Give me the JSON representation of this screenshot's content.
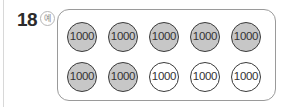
{
  "question": {
    "number": "18",
    "badge": "예"
  },
  "coins": {
    "label": "1000",
    "rows": [
      [
        "gray",
        "gray",
        "gray",
        "gray",
        "gray"
      ],
      [
        "gray",
        "gray",
        "white",
        "white",
        "white"
      ]
    ]
  },
  "colors": {
    "filled": "#c7c7c7",
    "empty": "#ffffff",
    "outline": "#3a3a3a"
  }
}
